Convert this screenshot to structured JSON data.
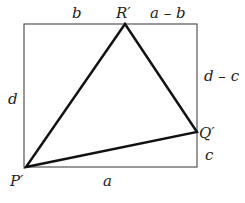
{
  "diagram": {
    "rectangle": {
      "x": 24,
      "y": 24,
      "width": 173,
      "height": 143
    },
    "points": {
      "P": {
        "label": "P′",
        "x": 26,
        "y": 167
      },
      "Q": {
        "label": "Q′",
        "x": 197,
        "y": 132
      },
      "R": {
        "label": "R′",
        "x": 125,
        "y": 24
      }
    },
    "edge_labels": {
      "top_left": "b",
      "top_right": "a – b",
      "left": "d",
      "right_upper": "d – c",
      "right_lower": "c",
      "bottom": "a"
    },
    "colors": {
      "rect": "#555555",
      "triangle": "#111111",
      "text": "#222222"
    }
  }
}
